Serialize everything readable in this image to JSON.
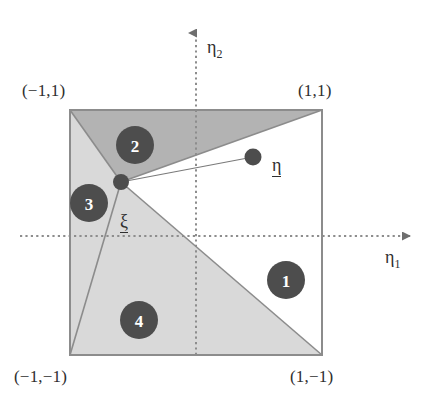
{
  "figure": {
    "title_region_labels": [
      "1",
      "2",
      "3",
      "4"
    ],
    "corners": [
      {
        "name": "top-left",
        "text": "(−1,1)",
        "x": 22,
        "y": 82
      },
      {
        "name": "top-right",
        "text": "(1,1)",
        "x": 298,
        "y": 82
      },
      {
        "name": "bottom-left",
        "text": "(−1,−1)",
        "x": 14,
        "y": 368
      },
      {
        "name": "bottom-right",
        "text": "(1,−1)",
        "x": 290,
        "y": 368
      }
    ],
    "axes": {
      "eta2": {
        "label": "η",
        "sub": "2",
        "x": 207,
        "y": 38
      },
      "eta1": {
        "label": "η",
        "sub": "1",
        "x": 385,
        "y": 248
      }
    },
    "points": [
      {
        "name": "xi-point",
        "label": "ξ",
        "cx": 121,
        "cy": 182,
        "r": 8,
        "label_x": 120,
        "label_y": 212
      },
      {
        "name": "eta-point",
        "label": "η",
        "cx": 253,
        "cy": 157,
        "r": 8.5,
        "label_x": 272,
        "label_y": 156
      }
    ],
    "regions": [
      {
        "id": "1",
        "number": "1",
        "cx": 286,
        "cy": 280,
        "r": 19,
        "fill": "#ffffff"
      },
      {
        "id": "2",
        "number": "2",
        "cx": 135,
        "cy": 145,
        "r": 19,
        "fill": "#b3b3b3"
      },
      {
        "id": "3",
        "number": "3",
        "cx": 89,
        "cy": 203,
        "r": 19,
        "fill": "#d9d9d9"
      },
      {
        "id": "4",
        "number": "4",
        "cx": 139,
        "cy": 320,
        "r": 19,
        "fill": "#d9d9d9"
      }
    ],
    "square": {
      "x0": 70,
      "y0": 110,
      "x1": 322,
      "y1": 355
    },
    "colors": {
      "marker_fill": "#4d4d4d",
      "region_mid_gray": "#b3b3b3",
      "region_light_gray": "#d9d9d9",
      "region_white": "#ffffff",
      "outline": "#8c8c8c",
      "axis": "#6e6e6e",
      "text": "#2e2e2e"
    }
  }
}
